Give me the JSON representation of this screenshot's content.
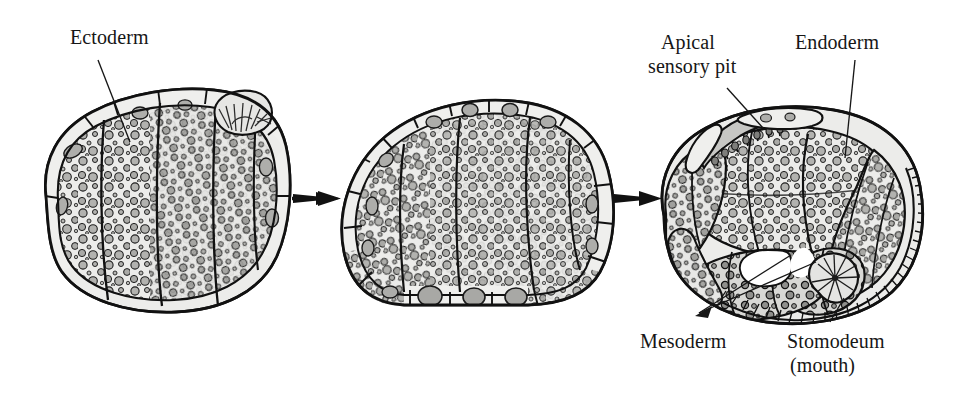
{
  "figure": {
    "type": "biological-diagram",
    "background_color": "#ffffff",
    "ink_color": "#161616",
    "cell_fill_color": "#ececea",
    "granule_fill_color": "#b0b0ae",
    "granule_dark_color": "#8d8d8a",
    "stage_count": 3,
    "arrow_count": 2
  },
  "labels": {
    "ectoderm": "Ectoderm",
    "apical_sensory_pit_line1": "Apical",
    "apical_sensory_pit_line2": "sensory pit",
    "endoderm": "Endoderm",
    "mesoderm": "Mesoderm",
    "stomodeum_line1": "Stomodeum",
    "stomodeum_line2": "(mouth)"
  },
  "stages": [
    {
      "name": "stage-1-blastula",
      "label_refs": [
        "ectoderm"
      ],
      "features": [
        "outer ectoderm cell layer",
        "yolk-laden macromeres",
        "apical tuft rosette"
      ]
    },
    {
      "name": "stage-2-gastrula",
      "label_refs": [],
      "features": [
        "dome-shaped cell mass",
        "columnar outer epithelium",
        "yolk granules"
      ]
    },
    {
      "name": "stage-3-trochophore",
      "label_refs": [
        "apical_sensory_pit",
        "endoderm",
        "mesoderm",
        "stomodeum"
      ],
      "features": [
        "apical sensory pit",
        "endoderm mass",
        "two mesoderm bands",
        "ciliated band",
        "stomodeum invagination"
      ]
    }
  ],
  "arrows": [
    {
      "name": "arrow-stage1-to-stage2",
      "direction": "right"
    },
    {
      "name": "arrow-stage2-to-stage3",
      "direction": "right"
    }
  ]
}
